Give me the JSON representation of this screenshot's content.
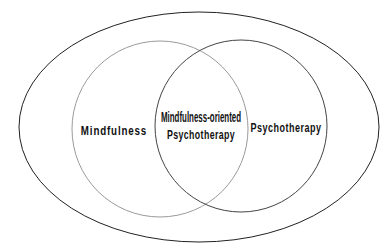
{
  "diagram": {
    "type": "venn",
    "outer_ellipse": {
      "cx": 199,
      "cy": 127,
      "rx": 180,
      "ry": 115,
      "stroke": "#222222"
    },
    "circles": [
      {
        "name": "mindfulness",
        "cx": 160,
        "cy": 129,
        "r": 88,
        "stroke": "#9a9a9a"
      },
      {
        "name": "psychotherapy",
        "cx": 241,
        "cy": 126,
        "r": 86,
        "stroke": "#444444"
      }
    ],
    "labels": {
      "left": "Mindfulness",
      "right": "Psychotherapy",
      "overlap_line1": "Mindfulness-oriented",
      "overlap_line2": "Psychotherapy"
    }
  }
}
